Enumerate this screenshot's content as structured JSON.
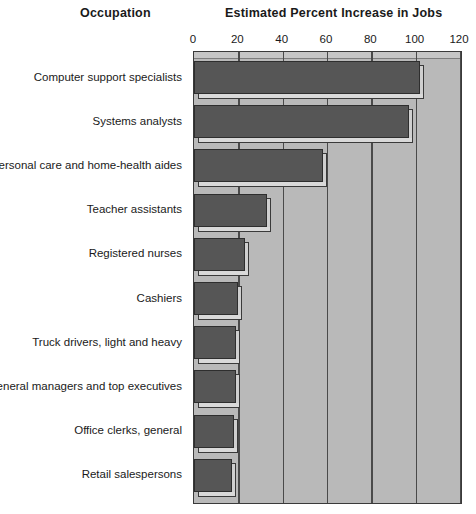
{
  "headers": {
    "category_header": "Occupation",
    "value_header": "Estimated Percent Increase in Jobs"
  },
  "chart_data": {
    "type": "bar",
    "orientation": "horizontal",
    "title": "Estimated Percent Increase in Jobs",
    "xlabel": "Estimated Percent Increase in Jobs",
    "ylabel": "Occupation",
    "xlim": [
      0,
      120
    ],
    "ticks": [
      0,
      20,
      40,
      60,
      80,
      100,
      120
    ],
    "grid": true,
    "legend": "none",
    "categories": [
      "Computer support specialists",
      "Systems analysts",
      "Personal care and home-health aides",
      "Teacher assistants",
      "Registered nurses",
      "Cashiers",
      "Truck drivers, light and heavy",
      "General managers and top executives",
      "Office clerks, general",
      "Retail salespersons"
    ],
    "values": [
      102,
      97,
      58,
      33,
      23,
      20,
      19,
      19,
      18,
      17
    ],
    "colors": {
      "bar_fill": "#565656",
      "bar_outline": "#2e2e2e",
      "bar_bevel": "#d4d4d4",
      "plot_background": "#b9b9b9",
      "gridline": "#4a4a4a",
      "text": "#1a1a1a"
    }
  }
}
